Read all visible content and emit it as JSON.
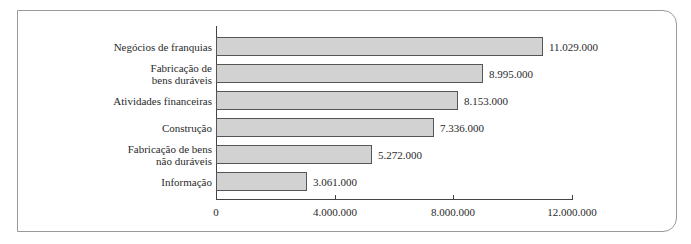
{
  "chart_data": {
    "type": "bar",
    "orientation": "horizontal",
    "title": "",
    "xlabel": "",
    "ylabel": "",
    "categories": [
      "Negócios de franquias",
      "Fabricação de\nbens duráveis",
      "Atividades financeiras",
      "Construção",
      "Fabricação de bens\nnão duráveis",
      "Informação"
    ],
    "values": [
      11029000,
      8995000,
      8153000,
      7336000,
      5272000,
      3061000
    ],
    "value_labels": [
      "11.029.000",
      "8.995.000",
      "8.153.000",
      "7.336.000",
      "5.272.000",
      "3.061.000"
    ],
    "xlim": [
      0,
      12000000
    ],
    "x_ticks": [
      0,
      4000000,
      8000000,
      12000000
    ],
    "x_tick_labels": [
      "0",
      "4.000.000",
      "8.000.000",
      "12.000.000"
    ],
    "grid": false,
    "legend": null,
    "bar_color": "#d2d2d2",
    "bar_border_color": "#555555"
  }
}
